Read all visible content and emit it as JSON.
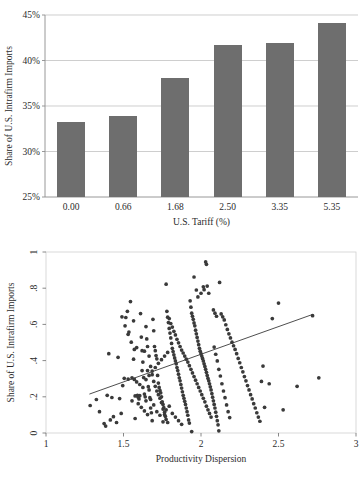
{
  "chart_data": [
    {
      "type": "bar",
      "title": "",
      "xlabel": "U.S. Tariff (%)",
      "ylabel": "Share of U.S. Intrafirm Imports",
      "categories": [
        "0.00",
        "0.66",
        "1.68",
        "2.50",
        "3.35",
        "5.35"
      ],
      "values": [
        33.3,
        33.9,
        38.1,
        41.7,
        41.9,
        44.1
      ],
      "ytick_labels": [
        "45%",
        "40%",
        "35%",
        "30%",
        "25%"
      ],
      "ytick_values": [
        45,
        40,
        35,
        30,
        25
      ],
      "ylim": [
        25,
        45
      ],
      "grid": true,
      "legend": "none",
      "bar_color": "#6e6e6e",
      "grid_color": "#b9b9b9",
      "axis_color": "#8d8d8d"
    },
    {
      "type": "scatter",
      "title": "",
      "xlabel": "Productivity Dispersion",
      "ylabel": "Share of U.S. Intrafirm Imports",
      "xtick_labels": [
        "1",
        "1.5",
        "2",
        "2.5",
        "3"
      ],
      "xtick_values": [
        1,
        1.5,
        2,
        2.5,
        3
      ],
      "ytick_labels": [
        "0",
        ".2",
        ".4",
        ".6",
        ".8",
        "1"
      ],
      "ytick_values": [
        0,
        0.2,
        0.4,
        0.6,
        0.8,
        1
      ],
      "xlim": [
        1,
        3
      ],
      "ylim": [
        0,
        1
      ],
      "grid": false,
      "legend": "none",
      "point_color": "#3a3a3a",
      "fit_color": "#3a3a3a",
      "fit_line": {
        "x0": 1.28,
        "y0": 0.215,
        "x1": 2.72,
        "y1": 0.655
      },
      "points": [
        [
          1.285,
          0.152
        ],
        [
          1.325,
          0.185
        ],
        [
          1.345,
          0.118
        ],
        [
          1.375,
          0.052
        ],
        [
          1.385,
          0.038
        ],
        [
          1.395,
          0.208
        ],
        [
          1.405,
          0.438
        ],
        [
          1.415,
          0.072
        ],
        [
          1.425,
          0.196
        ],
        [
          1.435,
          0.09
        ],
        [
          1.455,
          0.058
        ],
        [
          1.465,
          0.418
        ],
        [
          1.475,
          0.19
        ],
        [
          1.485,
          0.108
        ],
        [
          1.495,
          0.262
        ],
        [
          1.505,
          0.302
        ],
        [
          1.515,
          0.638
        ],
        [
          1.525,
          0.672
        ],
        [
          1.535,
          0.558
        ],
        [
          1.545,
          0.726
        ],
        [
          1.555,
          0.305
        ],
        [
          1.565,
          0.62
        ],
        [
          1.57,
          0.296
        ],
        [
          1.575,
          0.08
        ],
        [
          1.585,
          0.472
        ],
        [
          1.59,
          0.208
        ],
        [
          1.595,
          0.198
        ],
        [
          1.6,
          0.188
        ],
        [
          1.605,
          0.206
        ],
        [
          1.61,
          0.66
        ],
        [
          1.615,
          0.53
        ],
        [
          1.62,
          0.455
        ],
        [
          1.625,
          0.392
        ],
        [
          1.63,
          0.306
        ],
        [
          1.635,
          0.215
        ],
        [
          1.64,
          0.2
        ],
        [
          1.645,
          0.178
        ],
        [
          1.65,
          0.52
        ],
        [
          1.655,
          0.345
        ],
        [
          1.66,
          0.256
        ],
        [
          1.665,
          0.238
        ],
        [
          1.67,
          0.195
        ],
        [
          1.675,
          0.185
        ],
        [
          1.68,
          0.112
        ],
        [
          1.685,
          0.068
        ],
        [
          1.69,
          0.628
        ],
        [
          1.695,
          0.565
        ],
        [
          1.7,
          0.478
        ],
        [
          1.705,
          0.455
        ],
        [
          1.71,
          0.428
        ],
        [
          1.715,
          0.41
        ],
        [
          1.72,
          0.318
        ],
        [
          1.725,
          0.276
        ],
        [
          1.73,
          0.252
        ],
        [
          1.735,
          0.235
        ],
        [
          1.74,
          0.222
        ],
        [
          1.745,
          0.2
        ],
        [
          1.75,
          0.172
        ],
        [
          1.755,
          0.158
        ],
        [
          1.76,
          0.14
        ],
        [
          1.765,
          0.115
        ],
        [
          1.77,
          0.092
        ],
        [
          1.775,
          0.822
        ],
        [
          1.78,
          0.672
        ],
        [
          1.785,
          0.64
        ],
        [
          1.79,
          0.61
        ],
        [
          1.795,
          0.578
        ],
        [
          1.8,
          0.552
        ],
        [
          1.805,
          0.525
        ],
        [
          1.81,
          0.495
        ],
        [
          1.815,
          0.468
        ],
        [
          1.82,
          0.45
        ],
        [
          1.825,
          0.432
        ],
        [
          1.83,
          0.415
        ],
        [
          1.835,
          0.398
        ],
        [
          1.84,
          0.382
        ],
        [
          1.845,
          0.362
        ],
        [
          1.85,
          0.345
        ],
        [
          1.855,
          0.325
        ],
        [
          1.86,
          0.305
        ],
        [
          1.865,
          0.288
        ],
        [
          1.87,
          0.268
        ],
        [
          1.875,
          0.248
        ],
        [
          1.88,
          0.228
        ],
        [
          1.885,
          0.208
        ],
        [
          1.89,
          0.192
        ],
        [
          1.895,
          0.175
        ],
        [
          1.9,
          0.158
        ],
        [
          1.905,
          0.138
        ],
        [
          1.91,
          0.118
        ],
        [
          1.915,
          0.098
        ],
        [
          1.92,
          0.072
        ],
        [
          1.925,
          0.055
        ],
        [
          1.93,
          0.73
        ],
        [
          1.935,
          0.695
        ],
        [
          1.94,
          0.662
        ],
        [
          1.945,
          0.645
        ],
        [
          1.95,
          0.628
        ],
        [
          1.955,
          0.608
        ],
        [
          1.96,
          0.592
        ],
        [
          1.965,
          0.568
        ],
        [
          1.97,
          0.548
        ],
        [
          1.975,
          0.528
        ],
        [
          1.98,
          0.508
        ],
        [
          1.985,
          0.488
        ],
        [
          1.99,
          0.468
        ],
        [
          1.995,
          0.452
        ],
        [
          2.0,
          0.438
        ],
        [
          2.005,
          0.425
        ],
        [
          2.01,
          0.412
        ],
        [
          2.015,
          0.398
        ],
        [
          2.02,
          0.382
        ],
        [
          2.025,
          0.368
        ],
        [
          2.03,
          0.352
        ],
        [
          2.035,
          0.335
        ],
        [
          2.04,
          0.318
        ],
        [
          2.045,
          0.302
        ],
        [
          2.05,
          0.288
        ],
        [
          2.055,
          0.272
        ],
        [
          2.06,
          0.255
        ],
        [
          2.065,
          0.238
        ],
        [
          2.07,
          0.218
        ],
        [
          2.075,
          0.198
        ],
        [
          2.08,
          0.178
        ],
        [
          2.085,
          0.158
        ],
        [
          2.09,
          0.138
        ],
        [
          2.095,
          0.115
        ],
        [
          2.1,
          0.092
        ],
        [
          2.105,
          0.068
        ],
        [
          2.11,
          0.045
        ],
        [
          2.115,
          0.012
        ],
        [
          1.94,
          0.008
        ],
        [
          1.955,
          0.862
        ],
        [
          1.97,
          0.79
        ],
        [
          1.98,
          0.752
        ],
        [
          2.0,
          0.772
        ],
        [
          2.015,
          0.808
        ],
        [
          2.02,
          0.792
        ],
        [
          2.03,
          0.945
        ],
        [
          2.035,
          0.932
        ],
        [
          2.04,
          0.812
        ],
        [
          2.05,
          0.772
        ],
        [
          2.08,
          0.68
        ],
        [
          2.09,
          0.662
        ],
        [
          2.1,
          0.645
        ],
        [
          2.12,
          0.832
        ],
        [
          2.13,
          0.658
        ],
        [
          2.14,
          0.642
        ],
        [
          2.15,
          0.625
        ],
        [
          2.16,
          0.598
        ],
        [
          2.17,
          0.572
        ],
        [
          2.18,
          0.548
        ],
        [
          2.19,
          0.525
        ],
        [
          2.2,
          0.502
        ],
        [
          2.21,
          0.482
        ],
        [
          2.22,
          0.462
        ],
        [
          2.23,
          0.438
        ],
        [
          2.24,
          0.412
        ],
        [
          2.25,
          0.388
        ],
        [
          2.26,
          0.362
        ],
        [
          2.27,
          0.338
        ],
        [
          2.28,
          0.312
        ],
        [
          2.29,
          0.288
        ],
        [
          2.3,
          0.262
        ],
        [
          2.31,
          0.238
        ],
        [
          2.32,
          0.212
        ],
        [
          2.33,
          0.188
        ],
        [
          2.34,
          0.162
        ],
        [
          2.35,
          0.138
        ],
        [
          2.36,
          0.112
        ],
        [
          2.37,
          0.088
        ],
        [
          2.38,
          0.065
        ],
        [
          2.39,
          0.285
        ],
        [
          2.4,
          0.37
        ],
        [
          2.41,
          0.142
        ],
        [
          2.44,
          0.272
        ],
        [
          2.46,
          0.632
        ],
        [
          2.5,
          0.718
        ],
        [
          2.53,
          0.128
        ],
        [
          2.62,
          0.258
        ],
        [
          2.72,
          0.648
        ],
        [
          2.76,
          0.305
        ],
        [
          1.62,
          0.345
        ],
        [
          1.635,
          0.452
        ],
        [
          1.645,
          0.588
        ],
        [
          1.655,
          0.478
        ],
        [
          1.665,
          0.425
        ],
        [
          1.675,
          0.368
        ],
        [
          1.685,
          0.322
        ],
        [
          1.695,
          0.285
        ],
        [
          1.705,
          0.258
        ],
        [
          1.715,
          0.232
        ],
        [
          1.725,
          0.212
        ],
        [
          1.735,
          0.192
        ],
        [
          1.745,
          0.168
        ],
        [
          1.755,
          0.132
        ],
        [
          1.765,
          0.102
        ],
        [
          1.775,
          0.075
        ],
        [
          1.785,
          0.058
        ],
        [
          1.795,
          0.632
        ],
        [
          1.805,
          0.605
        ],
        [
          1.815,
          0.585
        ],
        [
          1.825,
          0.562
        ],
        [
          1.835,
          0.542
        ],
        [
          1.845,
          0.518
        ],
        [
          1.855,
          0.498
        ],
        [
          1.865,
          0.478
        ],
        [
          1.875,
          0.458
        ],
        [
          1.885,
          0.442
        ],
        [
          1.895,
          0.425
        ],
        [
          1.905,
          0.408
        ],
        [
          1.915,
          0.392
        ],
        [
          1.925,
          0.372
        ],
        [
          1.935,
          0.352
        ],
        [
          1.945,
          0.332
        ],
        [
          1.955,
          0.312
        ],
        [
          1.965,
          0.292
        ],
        [
          1.975,
          0.272
        ],
        [
          1.985,
          0.252
        ],
        [
          1.995,
          0.232
        ],
        [
          2.005,
          0.212
        ],
        [
          2.015,
          0.192
        ],
        [
          2.025,
          0.172
        ],
        [
          2.035,
          0.148
        ],
        [
          2.045,
          0.128
        ],
        [
          2.055,
          0.108
        ],
        [
          2.065,
          0.088
        ],
        [
          1.53,
          0.298
        ],
        [
          1.555,
          0.178
        ],
        [
          1.575,
          0.205
        ],
        [
          1.595,
          0.162
        ],
        [
          1.615,
          0.142
        ],
        [
          1.635,
          0.122
        ],
        [
          1.655,
          0.102
        ],
        [
          1.675,
          0.138
        ],
        [
          1.695,
          0.155
        ],
        [
          1.715,
          0.118
        ],
        [
          1.735,
          0.098
        ],
        [
          1.755,
          0.062
        ],
        [
          1.775,
          0.128
        ],
        [
          1.795,
          0.148
        ],
        [
          1.815,
          0.108
        ],
        [
          1.835,
          0.088
        ],
        [
          1.855,
          0.068
        ],
        [
          1.875,
          0.048
        ],
        [
          2.085,
          0.475
        ],
        [
          2.095,
          0.435
        ],
        [
          2.105,
          0.398
        ],
        [
          2.115,
          0.352
        ],
        [
          2.125,
          0.315
        ],
        [
          1.565,
          0.408
        ],
        [
          1.585,
          0.282
        ],
        [
          1.605,
          0.268
        ],
        [
          1.625,
          0.252
        ],
        [
          1.645,
          0.295
        ],
        [
          1.665,
          0.318
        ],
        [
          1.685,
          0.342
        ],
        [
          1.705,
          0.362
        ],
        [
          1.725,
          0.385
        ],
        [
          1.745,
          0.405
        ],
        [
          1.765,
          0.425
        ],
        [
          1.785,
          0.445
        ],
        [
          1.49,
          0.642
        ],
        [
          1.51,
          0.592
        ],
        [
          1.53,
          0.545
        ],
        [
          1.55,
          0.502
        ],
        [
          1.57,
          0.462
        ],
        [
          2.135,
          0.272
        ],
        [
          2.145,
          0.232
        ],
        [
          2.155,
          0.195
        ],
        [
          2.165,
          0.155
        ],
        [
          2.175,
          0.118
        ],
        [
          2.185,
          0.085
        ]
      ]
    }
  ],
  "bar_figure": {
    "name": "Bar chart: intrafirm import share by U.S. tariff"
  },
  "scatter_figure": {
    "name": "Scatter plot: intrafirm import share vs productivity dispersion"
  }
}
